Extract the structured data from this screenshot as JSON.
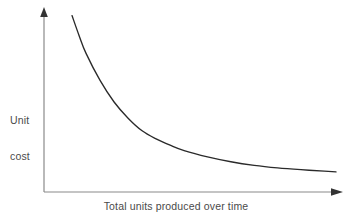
{
  "figure": {
    "background_color": "#ffffff",
    "axis_color": "#8a8a8a",
    "curve_color": "#2a2a2a",
    "text_color": "#4a4a4a"
  },
  "axes": {
    "y_label_line1": "Unit",
    "y_label_line2": "cost",
    "x_label": "Total units produced over time"
  },
  "chart_data": {
    "type": "line",
    "title": "",
    "xlabel": "Total units produced over time",
    "ylabel": "Unit cost",
    "grid": false,
    "legend": null,
    "annotations": [],
    "xlim": [
      0,
      100
    ],
    "ylim": [
      0,
      100
    ],
    "x_tick_labels": [],
    "y_tick_labels": [],
    "series": [
      {
        "name": "Unit cost",
        "x": [
          9.6,
          12.0,
          14.4,
          19.2,
          24.0,
          28.8,
          33.6,
          38.4,
          43.2,
          48.0,
          56.0,
          64.0,
          72.0,
          80.0,
          88.0,
          96.0,
          100.0
        ],
        "y": [
          98.0,
          87.0,
          77.0,
          62.0,
          50.0,
          41.0,
          34.0,
          29.5,
          26.0,
          23.0,
          19.5,
          16.8,
          14.8,
          13.4,
          12.4,
          11.6,
          11.2
        ]
      }
    ]
  }
}
